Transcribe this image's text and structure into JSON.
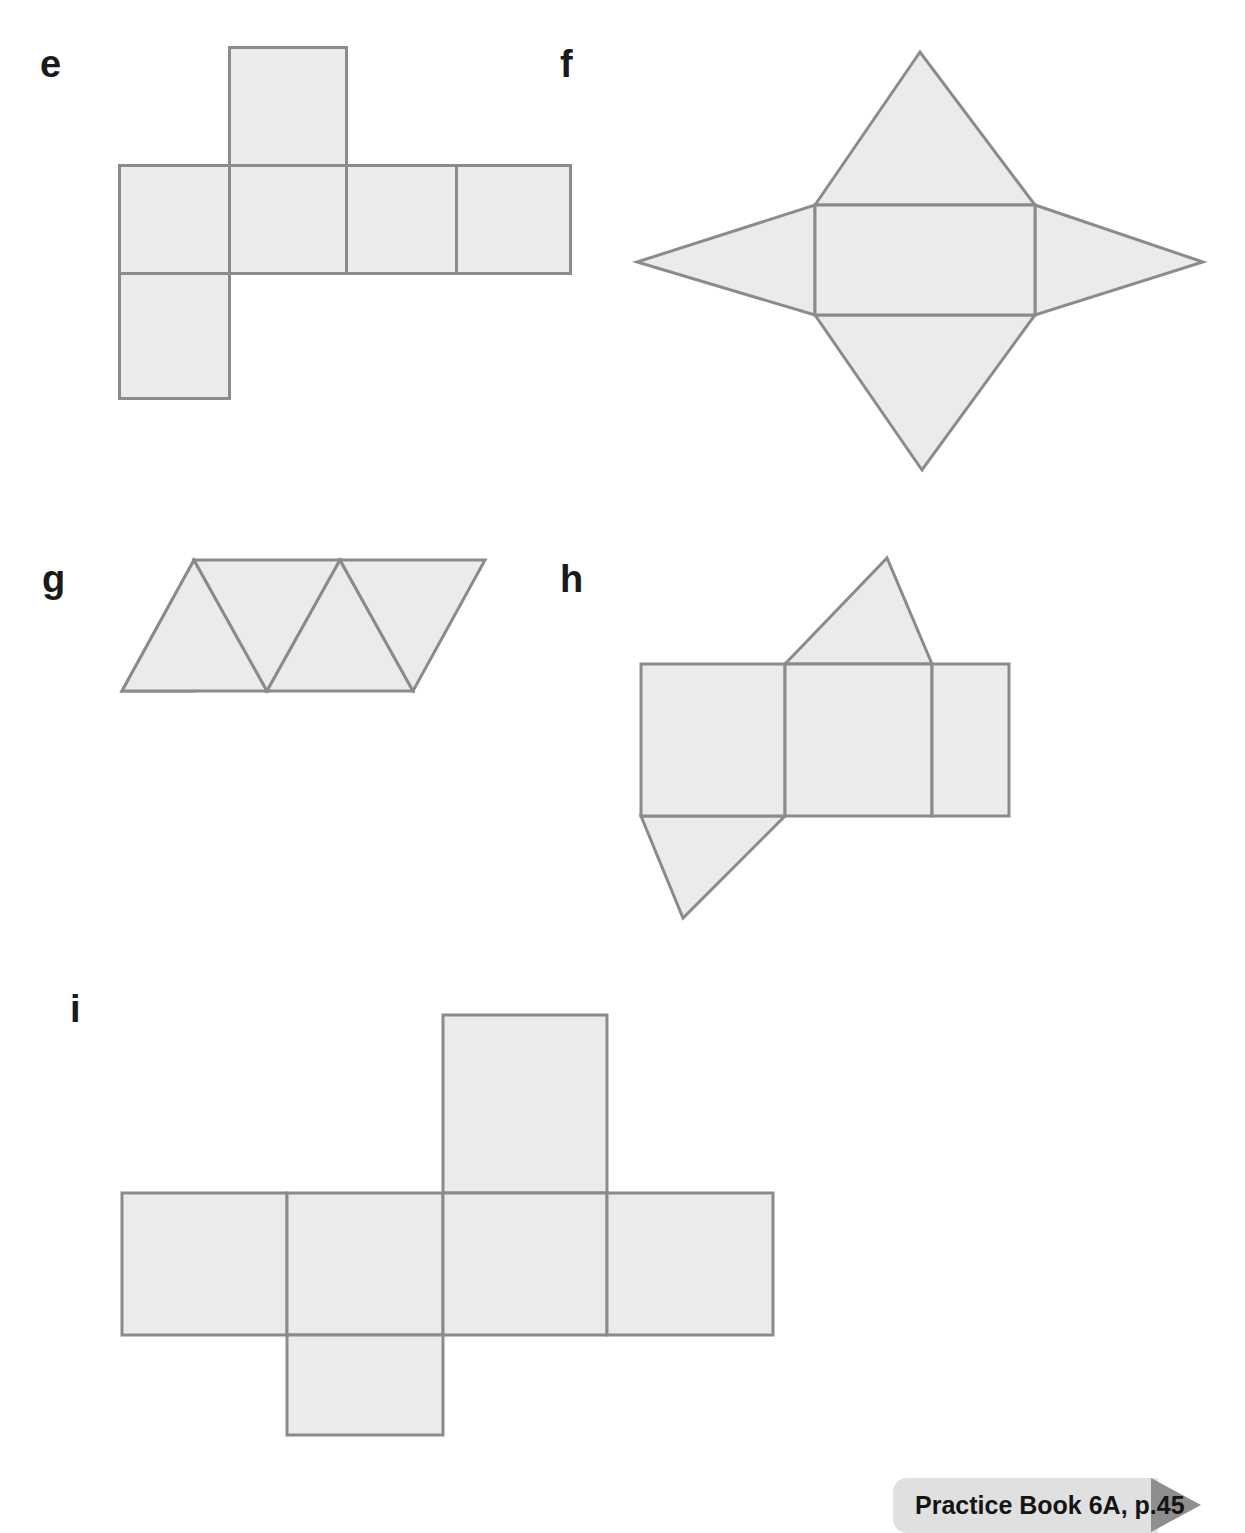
{
  "page": {
    "background_color": "#ffffff",
    "width": 1245,
    "height": 1533,
    "face_fill_color": "#ebebeb",
    "face_stroke_color": "#8b8b8b"
  },
  "nets": [
    {
      "label": "e",
      "description": "Net of a cuboid made of six rectangular faces arranged in a cross/T shape",
      "face_count": 6,
      "faces": [
        "top-rectangle",
        "row-rectangle-1",
        "row-rectangle-2",
        "row-rectangle-3",
        "row-rectangle-4",
        "bottom-rectangle"
      ]
    },
    {
      "label": "f",
      "description": "Net of a rectangular pyramid: central rectangle with four triangles attached to each side",
      "face_count": 5,
      "faces": [
        "center-rectangle",
        "top-triangle",
        "left-triangle",
        "right-triangle",
        "bottom-triangle"
      ]
    },
    {
      "label": "g",
      "description": "Net of a triangular pyramid (tetrahedron): parallelogram divided into four triangles",
      "face_count": 4,
      "faces": [
        "triangle-1",
        "triangle-2",
        "triangle-3",
        "triangle-4"
      ]
    },
    {
      "label": "h",
      "description": "Net of a triangular prism: three rectangles in a row with a triangle above and a triangle below",
      "face_count": 5,
      "faces": [
        "rectangle-left",
        "rectangle-middle",
        "rectangle-right",
        "top-triangle",
        "bottom-triangle"
      ]
    },
    {
      "label": "i",
      "description": "Net of a cuboid: four rectangles in a row with one rectangle above and one below",
      "face_count": 6,
      "faces": [
        "top-rectangle",
        "row-rectangle-1",
        "row-rectangle-2",
        "row-rectangle-3",
        "row-rectangle-4",
        "bottom-rectangle"
      ]
    }
  ],
  "footer": {
    "badge_label": "Practice Book 6A, p.45",
    "badge_color": "#e0e0e0",
    "badge_arrow_color": "#8e8e8e"
  }
}
